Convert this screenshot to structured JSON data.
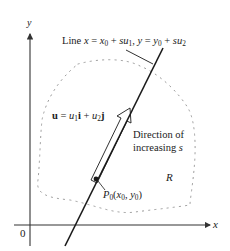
{
  "figure": {
    "axes": {
      "x_label": "x",
      "y_label": "y",
      "origin_label": "0"
    },
    "line_label": {
      "prefix": "Line ",
      "eq1_lhs": "x",
      "eq1_rhs_var": "x",
      "eq1_rhs_sub": "0",
      "eq1_s": "su",
      "eq1_s_sub": "1",
      "sep": ", ",
      "eq2_lhs": "y",
      "eq2_rhs_var": "y",
      "eq2_rhs_sub": "0",
      "eq2_s": "su",
      "eq2_s_sub": "2",
      "equals": " = ",
      "plus": " + "
    },
    "vector_label": {
      "u": "u",
      "equals": " = ",
      "u1": "u",
      "u1_sub": "1",
      "i": "i",
      "plus": " + ",
      "u2": "u",
      "u2_sub": "2",
      "j": "j"
    },
    "direction_label": {
      "line1": "Direction of",
      "line2_prefix": "increasing ",
      "line2_var": "s"
    },
    "region_label": "R",
    "point_label": {
      "P": "P",
      "P_sub": "0",
      "open": "(",
      "x": "x",
      "x_sub": "0",
      "comma": ", ",
      "y": "y",
      "y_sub": "0",
      "close": ")"
    },
    "colors": {
      "ink": "#1a1a1a",
      "dots": "#9a9a9a",
      "axis": "#333333"
    }
  }
}
